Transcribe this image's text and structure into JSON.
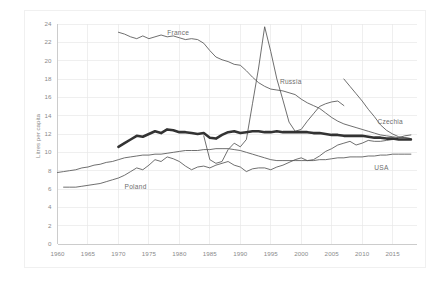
{
  "chart_data": {
    "type": "line",
    "title": "",
    "subtitle": "",
    "xlabel": "",
    "ylabel": "Litres per capita",
    "xlim": [
      1960,
      2019
    ],
    "ylim": [
      0,
      24
    ],
    "ytick_step": 2,
    "xtick_step": 5,
    "grid": true,
    "legend": "inline-labels",
    "xticks": [
      "1960",
      "1965",
      "1970",
      "1975",
      "1980",
      "1985",
      "1990",
      "1995",
      "2000",
      "2005",
      "2010",
      "2015"
    ],
    "yticks": [
      "0",
      "2",
      "4",
      "6",
      "8",
      "10",
      "12",
      "14",
      "16",
      "18",
      "20",
      "22",
      "24"
    ],
    "colors": {
      "grid": "#e8e8e8",
      "axis": "#c8c8c8",
      "thin_line": "#555555",
      "thick_line": "#333333",
      "text": "#8a8a8a"
    },
    "series": [
      {
        "name": "France",
        "label": "France",
        "emphasis": "thin",
        "label_x": 1978.0,
        "label_y": 22.9,
        "x": [
          1970,
          1971,
          1972,
          1973,
          1974,
          1975,
          1976,
          1977,
          1978,
          1979,
          1980,
          1981,
          1982,
          1983,
          1984,
          1985,
          1986,
          1987,
          1988,
          1989,
          1990,
          1991,
          1992,
          1993,
          1994,
          1995,
          1996,
          1997,
          1998,
          1999,
          2000,
          2001,
          2002,
          2003,
          2004,
          2005,
          2006,
          2007,
          2008,
          2009,
          2010,
          2011,
          2012,
          2013,
          2014,
          2015,
          2016,
          2017,
          2018
        ],
        "y": [
          23.1,
          22.9,
          22.6,
          22.4,
          22.7,
          22.4,
          22.6,
          22.8,
          22.6,
          22.7,
          22.5,
          22.3,
          22.4,
          22.3,
          21.9,
          21.1,
          20.4,
          20.1,
          19.9,
          19.6,
          19.5,
          18.9,
          18.2,
          17.6,
          17.2,
          16.9,
          16.8,
          16.7,
          16.5,
          16.3,
          15.8,
          15.4,
          15.1,
          14.8,
          14.3,
          13.8,
          13.4,
          13.1,
          12.9,
          12.7,
          12.5,
          12.3,
          12.1,
          11.9,
          11.8,
          11.7,
          11.6,
          11.6,
          11.5
        ]
      },
      {
        "name": "Russia",
        "label": "Russia",
        "emphasis": "thin",
        "label_x": 1996.5,
        "label_y": 17.6,
        "x": [
          1984,
          1985,
          1986,
          1987,
          1988,
          1989,
          1990,
          1991,
          1992,
          1993,
          1994,
          1995,
          1996,
          1997,
          1998,
          1999,
          2000,
          2001,
          2002,
          2003,
          2004,
          2005,
          2006,
          2007
        ],
        "y": [
          11.8,
          9.2,
          8.8,
          9.0,
          10.3,
          11.0,
          10.6,
          11.4,
          15.3,
          19.2,
          23.7,
          21.0,
          18.0,
          15.7,
          13.3,
          12.3,
          12.5,
          13.4,
          14.2,
          15.0,
          15.3,
          15.5,
          15.6,
          15.1
        ]
      },
      {
        "name": "Czechia",
        "label": "Czechia",
        "emphasis": "thin",
        "label_x": 2012.5,
        "label_y": 13.2,
        "x": [
          2007,
          2008,
          2009,
          2010,
          2011,
          2012,
          2013,
          2014,
          2015,
          2016,
          2017,
          2018
        ],
        "y": [
          18.0,
          17.2,
          16.4,
          15.6,
          14.7,
          13.9,
          13.0,
          12.4,
          12.0,
          11.7,
          11.6,
          11.5
        ]
      },
      {
        "name": "Poland",
        "label": "Poland",
        "emphasis": "thin",
        "label_x": 1971.0,
        "label_y": 6.1,
        "x": [
          1961,
          1962,
          1963,
          1964,
          1965,
          1966,
          1967,
          1968,
          1969,
          1970,
          1971,
          1972,
          1973,
          1974,
          1975,
          1976,
          1977,
          1978,
          1979,
          1980,
          1981,
          1982,
          1983,
          1984,
          1985,
          1986,
          1987,
          1988,
          1989,
          1990,
          1991,
          1992,
          1993,
          1994,
          1995,
          1996,
          1997,
          1998,
          1999,
          2000,
          2001,
          2002,
          2003,
          2004,
          2005,
          2006,
          2007,
          2008,
          2009,
          2010,
          2011,
          2012,
          2013,
          2014,
          2015,
          2016,
          2017,
          2018
        ],
        "y": [
          6.2,
          6.2,
          6.2,
          6.3,
          6.4,
          6.5,
          6.6,
          6.8,
          7.0,
          7.2,
          7.5,
          7.9,
          8.3,
          8.1,
          8.6,
          9.2,
          9.0,
          9.5,
          9.3,
          9.0,
          8.5,
          8.1,
          8.4,
          8.5,
          8.3,
          8.6,
          8.8,
          9.0,
          8.6,
          8.4,
          7.9,
          8.2,
          8.3,
          8.3,
          8.1,
          8.4,
          8.6,
          8.9,
          9.2,
          9.4,
          9.1,
          9.2,
          9.6,
          10.1,
          10.4,
          10.8,
          11.0,
          11.2,
          10.8,
          11.0,
          11.3,
          11.2,
          11.2,
          11.3,
          11.4,
          11.6,
          11.8,
          11.9
        ]
      },
      {
        "name": "USA",
        "label": "USA",
        "emphasis": "thin",
        "label_x": 2012.0,
        "label_y": 8.2,
        "x": [
          1960,
          1961,
          1962,
          1963,
          1964,
          1965,
          1966,
          1967,
          1968,
          1969,
          1970,
          1971,
          1972,
          1973,
          1974,
          1975,
          1976,
          1977,
          1978,
          1979,
          1980,
          1981,
          1982,
          1983,
          1984,
          1985,
          1986,
          1987,
          1988,
          1989,
          1990,
          1991,
          1992,
          1993,
          1994,
          1995,
          1996,
          1997,
          1998,
          1999,
          2000,
          2001,
          2002,
          2003,
          2004,
          2005,
          2006,
          2007,
          2008,
          2009,
          2010,
          2011,
          2012,
          2013,
          2014,
          2015,
          2016,
          2017,
          2018
        ],
        "y": [
          7.8,
          7.9,
          8.0,
          8.1,
          8.3,
          8.4,
          8.6,
          8.7,
          8.9,
          9.0,
          9.2,
          9.4,
          9.5,
          9.6,
          9.7,
          9.7,
          9.8,
          9.8,
          9.9,
          10.0,
          10.1,
          10.2,
          10.2,
          10.2,
          10.3,
          10.3,
          10.4,
          10.4,
          10.4,
          10.3,
          10.2,
          10.0,
          9.8,
          9.6,
          9.4,
          9.2,
          9.1,
          9.1,
          9.1,
          9.1,
          9.1,
          9.1,
          9.1,
          9.2,
          9.2,
          9.3,
          9.4,
          9.4,
          9.5,
          9.5,
          9.5,
          9.6,
          9.6,
          9.7,
          9.7,
          9.8,
          9.8,
          9.8,
          9.8
        ]
      },
      {
        "name": "Germany",
        "label": "",
        "emphasis": "thick",
        "label_x": null,
        "label_y": null,
        "x": [
          1970,
          1971,
          1972,
          1973,
          1974,
          1975,
          1976,
          1977,
          1978,
          1979,
          1980,
          1981,
          1982,
          1983,
          1984,
          1985,
          1986,
          1987,
          1988,
          1989,
          1990,
          1991,
          1992,
          1993,
          1994,
          1995,
          1996,
          1997,
          1998,
          1999,
          2000,
          2001,
          2002,
          2003,
          2004,
          2005,
          2006,
          2007,
          2008,
          2009,
          2010,
          2011,
          2012,
          2013,
          2014,
          2015,
          2016,
          2017,
          2018
        ],
        "y": [
          10.6,
          11.0,
          11.4,
          11.8,
          11.7,
          12.0,
          12.3,
          12.1,
          12.5,
          12.4,
          12.2,
          12.2,
          12.1,
          12.0,
          12.1,
          11.6,
          11.5,
          11.9,
          12.2,
          12.3,
          12.1,
          12.2,
          12.3,
          12.3,
          12.2,
          12.2,
          12.3,
          12.2,
          12.2,
          12.2,
          12.2,
          12.2,
          12.1,
          12.1,
          12.0,
          11.9,
          11.9,
          11.8,
          11.8,
          11.8,
          11.8,
          11.7,
          11.6,
          11.6,
          11.5,
          11.5,
          11.4,
          11.4,
          11.4
        ]
      }
    ]
  }
}
